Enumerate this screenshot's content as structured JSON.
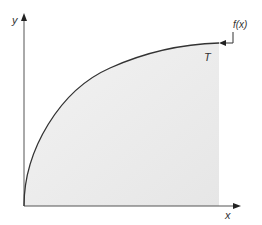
{
  "diagram": {
    "axis_labels": {
      "y": "y",
      "x": "x"
    },
    "curve_label": "T",
    "function_label": "f(x)",
    "colors": {
      "axis": "#555555",
      "curve": "#333333",
      "fill": "#ececec",
      "text": "#333333"
    }
  }
}
